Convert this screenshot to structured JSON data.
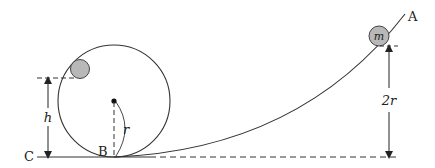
{
  "diagram": {
    "type": "physics-loop-the-loop",
    "labels": {
      "point_a": "A",
      "point_b": "B",
      "point_c": "C",
      "mass": "m",
      "height": "h",
      "radius": "r",
      "start_height": "2r"
    },
    "colors": {
      "line": "#333333",
      "ball_fill": "#b8b8b8",
      "ball_stroke": "#444444",
      "background": "#ffffff"
    },
    "elements": {
      "loop": {
        "cx": 114,
        "cy": 101,
        "r": 56
      },
      "ball_in_loop": {
        "cx": 80,
        "cy": 70,
        "r": 9
      },
      "ball_m": {
        "cx": 379,
        "cy": 36,
        "r": 10
      },
      "ground_y": 157
    }
  }
}
